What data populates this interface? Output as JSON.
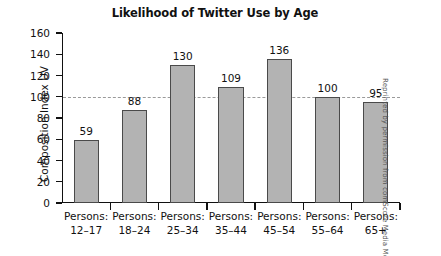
{
  "chart_data": {
    "type": "bar",
    "title": "Likelihood of Twitter Use by Age",
    "xlabel": "",
    "ylabel": "Composition Index UV",
    "categories": [
      "Persons: 12–17",
      "Persons: 18–24",
      "Persons: 25–34",
      "Persons: 35–44",
      "Persons: 45–54",
      "Persons: 55–64",
      "Persons: 65+"
    ],
    "category_lines": [
      [
        "Persons:",
        "12–17"
      ],
      [
        "Persons:",
        "18–24"
      ],
      [
        "Persons:",
        "25–34"
      ],
      [
        "Persons:",
        "35–44"
      ],
      [
        "Persons:",
        "45–54"
      ],
      [
        "Persons:",
        "55–64"
      ],
      [
        "Persons:",
        "65+"
      ]
    ],
    "values": [
      59,
      88,
      130,
      109,
      136,
      100,
      95
    ],
    "ylim": [
      0,
      160
    ],
    "yticks": [
      0,
      20,
      40,
      60,
      80,
      100,
      120,
      140,
      160
    ],
    "ytick_labels": [
      "0",
      "20",
      "40",
      "60",
      "80",
      "100",
      "120",
      "140",
      "160"
    ],
    "grid": false,
    "legend": "none",
    "reference_line": {
      "value": 100,
      "style": "dashed",
      "color": "#9a9a9a"
    },
    "bar_color": "#b3b3b3",
    "bar_edge_color": "#4a4a4a",
    "data_labels_shown": true
  },
  "credit": {
    "text": "Reprinted by permission from comScore Media Metrix"
  }
}
